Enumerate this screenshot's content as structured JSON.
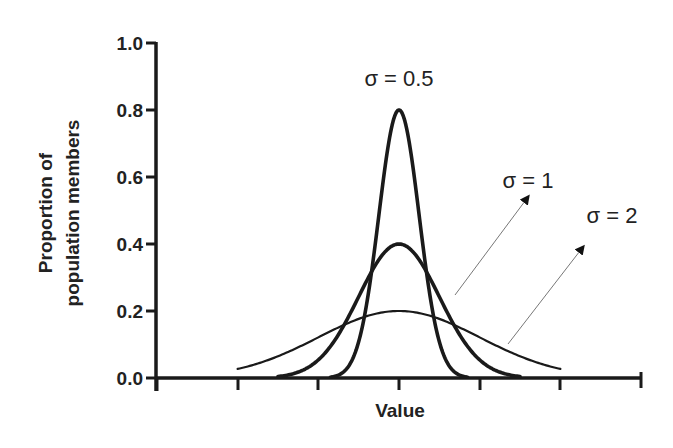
{
  "chart_data": {
    "type": "line",
    "title": "",
    "xlabel": "Value",
    "ylabel": "Proportion of population members",
    "ylabel_lines": [
      "Proportion of",
      "population members"
    ],
    "xlim": [
      -6,
      6
    ],
    "ylim": [
      0,
      1.0
    ],
    "x_ticks": [
      -6,
      -4,
      -2,
      0,
      2,
      4,
      6
    ],
    "x_tick_labels_shown": false,
    "y_ticks": [
      0.0,
      0.2,
      0.4,
      0.6,
      0.8,
      1.0
    ],
    "y_tick_labels": [
      "0.0",
      "0.2",
      "0.4",
      "0.6",
      "0.8",
      "1.0"
    ],
    "grid": false,
    "legend": "none (inline annotations)",
    "series": [
      {
        "name": "σ = 0.5",
        "sigma": 0.5,
        "mean": 0,
        "peak": 0.8,
        "x_range": [
          -1.7,
          1.7
        ],
        "stroke_width": 3.5
      },
      {
        "name": "σ = 1",
        "sigma": 1,
        "mean": 0,
        "peak": 0.4,
        "x_range": [
          -3,
          3
        ],
        "stroke_width": 3.5
      },
      {
        "name": "σ = 2",
        "sigma": 2,
        "mean": 0,
        "peak": 0.2,
        "x_range": [
          -4,
          4
        ],
        "stroke_width": 2
      }
    ],
    "annotations": [
      {
        "text": "σ = 0.5",
        "position": "above peak"
      },
      {
        "text": "σ = 1",
        "arrow": true
      },
      {
        "text": "σ = 2",
        "arrow": true
      }
    ]
  },
  "labels": {
    "xlabel": "Value",
    "ylabel_line1": "Proportion of",
    "ylabel_line2": "population members",
    "y0": "0.0",
    "y1": "0.2",
    "y2": "0.4",
    "y3": "0.6",
    "y4": "0.8",
    "y5": "1.0",
    "annot_s05": "σ = 0.5",
    "annot_s1": "σ = 1",
    "annot_s2": "σ = 2"
  }
}
